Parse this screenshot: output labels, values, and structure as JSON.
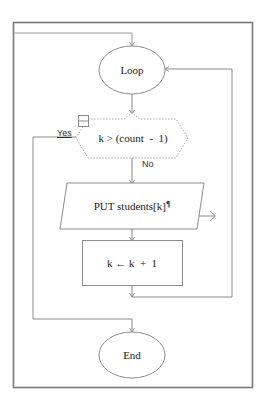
{
  "diagram": {
    "type": "flowchart",
    "nodes": {
      "loop": {
        "shape": "ellipse",
        "label": "Loop"
      },
      "condition": {
        "shape": "hexagon",
        "label": "k > (count  -  1)",
        "selected": true
      },
      "output": {
        "shape": "parallelogram",
        "label": "PUT students[k]",
        "trailing_mark": "¶"
      },
      "increment": {
        "shape": "rectangle",
        "label": "k ← k  +  1"
      },
      "end": {
        "shape": "ellipse",
        "label": "End"
      }
    },
    "branches": {
      "yes": "Yes",
      "no": "No"
    },
    "colors": {
      "line": "#8a8a8a",
      "frame": "#7a7a7a",
      "shape_stroke": "#8c8c8c",
      "selected_stroke": "#b0b0b0",
      "text": "#222222",
      "background": "#ffffff"
    }
  }
}
